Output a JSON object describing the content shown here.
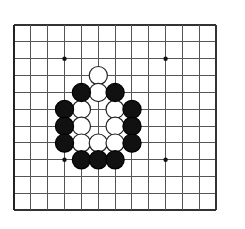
{
  "figure": {
    "background_color": "#ffffff"
  },
  "board": {
    "name": "goban",
    "line_color": "#555555",
    "border_color": "#333333",
    "border_left_color": "#222222",
    "grid_spacing": 16.85,
    "origin_x": 14,
    "origin_y": 25,
    "columns": 12,
    "rows": 11,
    "line_width": 1,
    "border_width": 2.2,
    "star_point_color": "#111111",
    "star_point_radius": 2.2,
    "star_points": [
      {
        "col": 3,
        "row": 2,
        "x": 64.5,
        "y": 58.7
      },
      {
        "col": 9,
        "row": 2,
        "x": 165.6,
        "y": 58.7
      },
      {
        "col": 3,
        "row": 8,
        "x": 64.5,
        "y": 159.8
      },
      {
        "col": 9,
        "row": 8,
        "x": 165.6,
        "y": 159.8
      }
    ]
  },
  "stones": {
    "black_fill": "#111111",
    "black_stroke": "#000000",
    "white_fill": "#ffffff",
    "white_stroke": "#222222",
    "radius": 9.1,
    "stroke_width": 1.2,
    "black_count": 14,
    "white_count": 11,
    "black": [
      {
        "label": "B1",
        "col": 4,
        "row": 4,
        "x": 81.4,
        "y": 92.5
      },
      {
        "label": "B2",
        "col": 6,
        "row": 4,
        "x": 115.1,
        "y": 92.5
      },
      {
        "label": "B3",
        "col": 3,
        "row": 5,
        "x": 64.5,
        "y": 109.4
      },
      {
        "label": "B4",
        "col": 7,
        "row": 5,
        "x": 132.0,
        "y": 109.4
      },
      {
        "label": "B5",
        "col": 3,
        "row": 6,
        "x": 64.5,
        "y": 126.2
      },
      {
        "label": "B6",
        "col": 7,
        "row": 6,
        "x": 132.0,
        "y": 126.2
      },
      {
        "label": "B7",
        "col": 3,
        "row": 7,
        "x": 64.5,
        "y": 143.1
      },
      {
        "label": "B8",
        "col": 7,
        "row": 7,
        "x": 132.0,
        "y": 143.1
      },
      {
        "label": "B9",
        "col": 4,
        "row": 8,
        "x": 81.4,
        "y": 159.8
      },
      {
        "label": "B10",
        "col": 5,
        "row": 8,
        "x": 98.3,
        "y": 159.8
      },
      {
        "label": "B11",
        "col": 6,
        "row": 8,
        "x": 115.1,
        "y": 159.8
      }
    ],
    "white": [
      {
        "label": "W1",
        "col": 5,
        "row": 3,
        "x": 98.3,
        "y": 75.6
      },
      {
        "label": "W2",
        "col": 5,
        "row": 4,
        "x": 98.3,
        "y": 92.5
      },
      {
        "label": "W3",
        "col": 4,
        "row": 5,
        "x": 81.4,
        "y": 109.4
      },
      {
        "label": "W4",
        "col": 6,
        "row": 5,
        "x": 115.1,
        "y": 109.4
      },
      {
        "label": "W5",
        "col": 4,
        "row": 6,
        "x": 81.4,
        "y": 126.2
      },
      {
        "label": "W6",
        "col": 6,
        "row": 6,
        "x": 115.1,
        "y": 126.2
      },
      {
        "label": "W7",
        "col": 4,
        "row": 7,
        "x": 81.4,
        "y": 143.1
      },
      {
        "label": "W8",
        "col": 5,
        "row": 7,
        "x": 98.3,
        "y": 143.1
      },
      {
        "label": "W9",
        "col": 6,
        "row": 7,
        "x": 115.1,
        "y": 143.1
      }
    ],
    "empty_points": [
      {
        "label": "E1",
        "col": 5,
        "row": 5,
        "x": 98.3,
        "y": 109.4
      },
      {
        "label": "E2",
        "col": 5,
        "row": 6,
        "x": 98.3,
        "y": 126.2
      }
    ]
  }
}
